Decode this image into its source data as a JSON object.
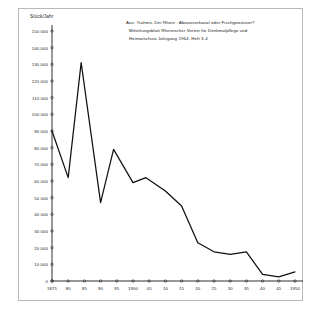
{
  "figure": {
    "unit_label": "Stück/Jahr",
    "source_note": [
      "Aus: Trahms, Der Rhein : Abwasserkanal oder Fischgewässer?",
      "Mitteilungsblatt Rheinischer Verein für Denkmalpflege und",
      "Heimatschutz  Jahrgang 1964, Heft 3-4"
    ],
    "axis_color": "#1a1a1a",
    "line_color": "#111111",
    "frame_color": "#b9b9b9",
    "background": "#ffffff"
  },
  "chart_data": {
    "type": "line",
    "title": "",
    "xlabel": "",
    "ylabel": "Stück/Jahr",
    "ylim": [
      0,
      150000
    ],
    "xlim": [
      1875,
      1950
    ],
    "grid": false,
    "legend": "none",
    "ytick_labels": [
      "150 000",
      "140 000",
      "130 000",
      "120 000",
      "110 000",
      "100 000",
      "90 000",
      "80 000",
      "70 000",
      "60 000",
      "50 000",
      "40 000",
      "30 000",
      "20 000",
      "10 000",
      "0"
    ],
    "ytick_values": [
      150000,
      140000,
      130000,
      120000,
      110000,
      100000,
      90000,
      80000,
      70000,
      60000,
      50000,
      40000,
      30000,
      20000,
      10000,
      0
    ],
    "xtick_labels": [
      "1875",
      "80",
      "85",
      "90",
      "95",
      "1900",
      "05",
      "10",
      "15",
      "20",
      "25",
      "30",
      "35",
      "40",
      "45",
      "1950"
    ],
    "xtick_values": [
      1875,
      1880,
      1885,
      1890,
      1895,
      1900,
      1905,
      1910,
      1915,
      1920,
      1925,
      1930,
      1935,
      1940,
      1945,
      1950
    ],
    "x": [
      1875,
      1880,
      1884,
      1890,
      1894,
      1900,
      1904,
      1910,
      1915,
      1920,
      1925,
      1930,
      1935,
      1940,
      1945,
      1950
    ],
    "values": [
      90000,
      62000,
      131000,
      47000,
      79000,
      59000,
      62000,
      54000,
      45000,
      23000,
      17500,
      16000,
      17500,
      4000,
      2500,
      5500
    ]
  }
}
